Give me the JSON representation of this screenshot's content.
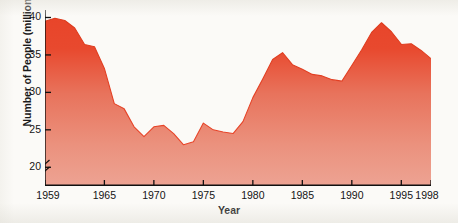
{
  "chart_data": {
    "type": "area",
    "title": "",
    "xlabel": "Year",
    "ylabel": "Number of People (millions)",
    "xlim": [
      1959,
      1998
    ],
    "ylim": [
      17.5,
      41
    ],
    "y_axis_break": true,
    "grid": false,
    "legend": "none",
    "series_name": "Number of People",
    "fill_top_color": "#e8452a",
    "fill_bottom_color": "#eb9a87",
    "line_color": "#d93c20",
    "axis_color": "#101010",
    "background_color": "#fbfaf7",
    "ytick_labels": [
      "20",
      "25",
      "30",
      "35",
      "40"
    ],
    "ytick_values": [
      20,
      25,
      30,
      35,
      40
    ],
    "xtick_labels": [
      "1959",
      "1965",
      "1970",
      "1975",
      "1980",
      "1985",
      "1990",
      "1995",
      "1998"
    ],
    "xtick_values": [
      1959,
      1965,
      1970,
      1975,
      1980,
      1985,
      1990,
      1995,
      1998
    ],
    "x": [
      1959,
      1960,
      1961,
      1962,
      1963,
      1964,
      1965,
      1966,
      1967,
      1968,
      1969,
      1970,
      1971,
      1972,
      1973,
      1974,
      1975,
      1976,
      1977,
      1978,
      1979,
      1980,
      1981,
      1982,
      1983,
      1984,
      1985,
      1986,
      1987,
      1988,
      1989,
      1990,
      1991,
      1992,
      1993,
      1994,
      1995,
      1996,
      1997,
      1998
    ],
    "values": [
      39.5,
      39.9,
      39.6,
      38.6,
      36.4,
      36.1,
      33.2,
      28.5,
      27.8,
      25.4,
      24.1,
      25.4,
      25.6,
      24.5,
      23.0,
      23.4,
      25.9,
      25.0,
      24.7,
      24.5,
      26.1,
      29.3,
      31.8,
      34.4,
      35.3,
      33.7,
      33.1,
      32.4,
      32.2,
      31.7,
      31.5,
      33.6,
      35.7,
      38.0,
      39.3,
      38.1,
      36.4,
      36.5,
      35.6,
      34.5
    ],
    "values_note": "Values read from plotted area silhouette; y units are millions of people"
  },
  "figure": {
    "axis_break_symbol": "zigzag-break"
  }
}
